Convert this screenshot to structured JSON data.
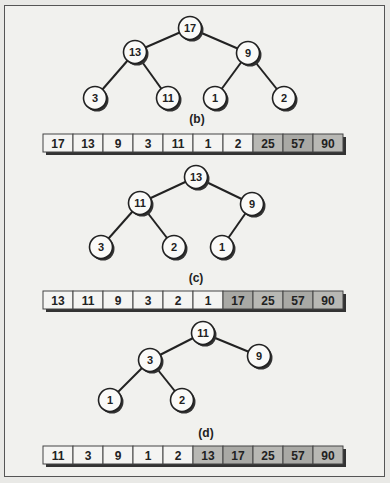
{
  "colors": {
    "unsorted_cell": "#f4f4f2",
    "sorted_cell": "#b8b8b4",
    "sorted_cell_dark": "#a9a9a5",
    "node_fill": "#fafaf8",
    "stroke": "#222222"
  },
  "panels": [
    {
      "label": "(b)",
      "label_pos": [
        197,
        123
      ],
      "array_y": 134,
      "array": [
        "17",
        "13",
        "9",
        "3",
        "11",
        "1",
        "2",
        "25",
        "57",
        "90"
      ],
      "sorted_from": 7,
      "nodes": [
        {
          "id": "n0",
          "value": "17",
          "x": 190,
          "y": 28
        },
        {
          "id": "n1",
          "value": "13",
          "x": 135,
          "y": 52
        },
        {
          "id": "n2",
          "value": "9",
          "x": 248,
          "y": 53
        },
        {
          "id": "n3",
          "value": "3",
          "x": 95,
          "y": 98
        },
        {
          "id": "n4",
          "value": "11",
          "x": 168,
          "y": 98
        },
        {
          "id": "n5",
          "value": "1",
          "x": 215,
          "y": 98
        },
        {
          "id": "n6",
          "value": "2",
          "x": 284,
          "y": 98
        }
      ],
      "edges": [
        [
          "n0",
          "n1"
        ],
        [
          "n0",
          "n2"
        ],
        [
          "n1",
          "n3"
        ],
        [
          "n1",
          "n4"
        ],
        [
          "n2",
          "n5"
        ],
        [
          "n2",
          "n6"
        ]
      ]
    },
    {
      "label": "(c)",
      "label_pos": [
        196,
        282
      ],
      "array_y": 291,
      "array": [
        "13",
        "11",
        "9",
        "3",
        "2",
        "1",
        "17",
        "25",
        "57",
        "90"
      ],
      "sorted_from": 6,
      "nodes": [
        {
          "id": "n0",
          "value": "13",
          "x": 196,
          "y": 177
        },
        {
          "id": "n1",
          "value": "11",
          "x": 140,
          "y": 203
        },
        {
          "id": "n2",
          "value": "9",
          "x": 252,
          "y": 204
        },
        {
          "id": "n3",
          "value": "3",
          "x": 101,
          "y": 247
        },
        {
          "id": "n4",
          "value": "2",
          "x": 174,
          "y": 247
        },
        {
          "id": "n5",
          "value": "1",
          "x": 222,
          "y": 247
        }
      ],
      "edges": [
        [
          "n0",
          "n1"
        ],
        [
          "n0",
          "n2"
        ],
        [
          "n1",
          "n3"
        ],
        [
          "n1",
          "n4"
        ],
        [
          "n2",
          "n5"
        ]
      ]
    },
    {
      "label": "(d)",
      "label_pos": [
        206,
        437
      ],
      "array_y": 446,
      "array": [
        "11",
        "3",
        "9",
        "1",
        "2",
        "13",
        "17",
        "25",
        "57",
        "90"
      ],
      "sorted_from": 5,
      "nodes": [
        {
          "id": "n0",
          "value": "11",
          "x": 203,
          "y": 333
        },
        {
          "id": "n1",
          "value": "3",
          "x": 150,
          "y": 360
        },
        {
          "id": "n2",
          "value": "9",
          "x": 259,
          "y": 356
        },
        {
          "id": "n3",
          "value": "1",
          "x": 110,
          "y": 400
        },
        {
          "id": "n4",
          "value": "2",
          "x": 182,
          "y": 400
        }
      ],
      "edges": [
        [
          "n0",
          "n1"
        ],
        [
          "n0",
          "n2"
        ],
        [
          "n1",
          "n3"
        ],
        [
          "n1",
          "n4"
        ]
      ]
    }
  ]
}
